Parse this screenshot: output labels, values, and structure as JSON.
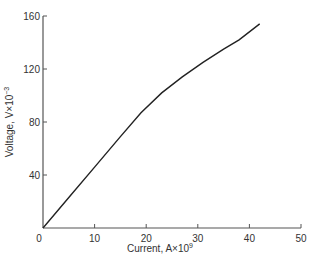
{
  "chart_data": {
    "type": "line",
    "title": "",
    "xlabel": "Current, A×10",
    "xlabel_exp": "9",
    "ylabel": "Voltage, V×10",
    "ylabel_exp": "−3",
    "xlim": [
      0,
      50
    ],
    "ylim": [
      0,
      160
    ],
    "xticks": [
      0,
      10,
      20,
      30,
      40,
      50
    ],
    "yticks": [
      0,
      40,
      80,
      120,
      160
    ],
    "grid": false,
    "legend": null,
    "series": [
      {
        "name": "V-I curve",
        "x": [
          0,
          5,
          10,
          15,
          19,
          23,
          27,
          31,
          35,
          38,
          42
        ],
        "y": [
          0,
          23,
          46,
          69,
          87,
          102,
          114,
          125,
          135,
          142,
          154
        ]
      }
    ]
  },
  "colors": {
    "line": "#222222",
    "axis": "#555555",
    "text": "#333333"
  }
}
